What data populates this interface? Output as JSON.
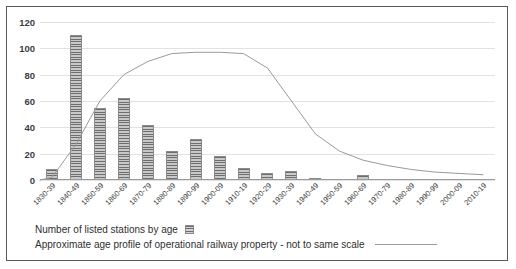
{
  "chart_data": {
    "type": "bar",
    "title": "",
    "xlabel": "",
    "ylabel": "",
    "ylim": [
      0,
      120
    ],
    "yticks": [
      0,
      20,
      40,
      60,
      80,
      100,
      120
    ],
    "grid": true,
    "legend_position": "bottom-left",
    "categories": [
      "1830-39",
      "1840-49",
      "1850-59",
      "1860-69",
      "1870-79",
      "1880-89",
      "1890-99",
      "1900-09",
      "1910-19",
      "1920-29",
      "1930-39",
      "1940-49",
      "1950-59",
      "1960-69",
      "1970-79",
      "1980-89",
      "1990-99",
      "2000-09",
      "2010-19"
    ],
    "series": [
      {
        "name": "Number of listed stations by age",
        "type": "bar",
        "values": [
          8,
          110,
          55,
          62,
          42,
          22,
          31,
          18,
          9,
          5,
          7,
          1,
          0,
          4,
          0,
          0,
          0,
          0,
          0
        ]
      },
      {
        "name": "Approximate age profile of operational railway property - not to same scale",
        "type": "line",
        "values": [
          2,
          27,
          60,
          80,
          90,
          96,
          97,
          97,
          96,
          85,
          60,
          35,
          22,
          15,
          11,
          8,
          6,
          5,
          4
        ]
      }
    ]
  },
  "axis": {
    "ytick_labels": [
      "0",
      "20",
      "40",
      "60",
      "80",
      "100",
      "120"
    ]
  },
  "legend": {
    "bars_label": "Number of listed stations by age",
    "line_label": "Approximate age profile of operational railway property - not to same scale",
    "bars_swatch_icon": "striped-square-icon",
    "line_swatch_icon": "horizontal-line-icon"
  },
  "colors": {
    "bar_fill": "#9d9d9d",
    "bar_stripe": "#6e6e6e",
    "line": "#9a9a9a",
    "grid": "#e2e2e2",
    "text": "#3d3d3d",
    "border": "#58595b",
    "background": "#ffffff"
  }
}
